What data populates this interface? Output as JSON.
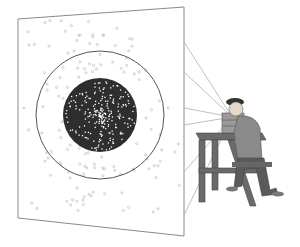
{
  "scene": {
    "description": "Man seated at a wooden table operating a small box device that emits rays onto a tilted screen with a dark central disc of scattered dots inside a ring",
    "colors": {
      "background": "#ffffff",
      "screen_border": "#888888",
      "ring": "#555555",
      "disc": "#2e2e2e",
      "dot_light": "#bbbbbb",
      "dot_inner": "#ffffff",
      "rays": "#aaaaaa",
      "table": "#666666",
      "shirt": "#8a8a8a",
      "pants": "#5a5a5a",
      "skin": "#e6d8c8",
      "cap": "#333333"
    },
    "screen": {
      "corners": [
        [
          18,
          14
        ],
        [
          184,
          7
        ],
        [
          184,
          236
        ],
        [
          18,
          218
        ]
      ]
    },
    "ring": {
      "cx": 100,
      "cy": 115,
      "r": 64
    },
    "disc": {
      "cx": 100,
      "cy": 115,
      "r": 37
    }
  }
}
